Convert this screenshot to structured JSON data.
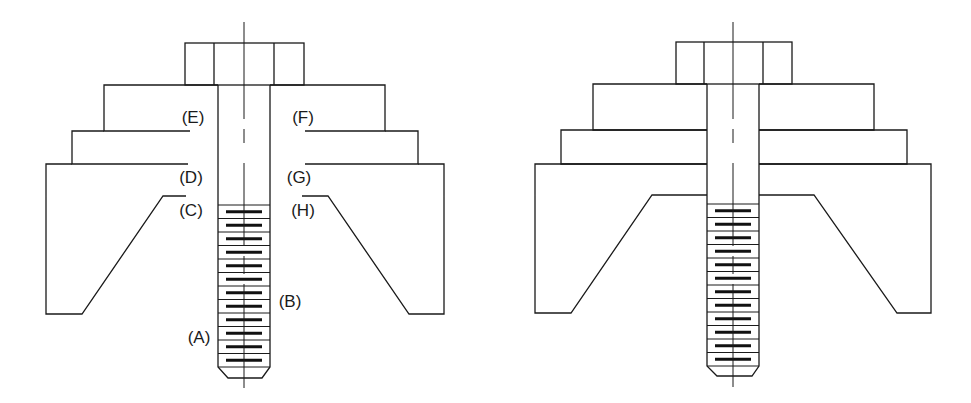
{
  "diagram": {
    "type": "technical-cross-section",
    "line_color": "#1a1a1a",
    "background": "#ffffff"
  },
  "views": [
    {
      "id": "labeled",
      "cx": 244,
      "head": {
        "x1": 185,
        "x2": 304,
        "y1": 43,
        "y2": 85,
        "inner": [
          214,
          274
        ]
      },
      "washer": {
        "x1": 104,
        "x2": 385,
        "y1": 85,
        "y2": 131
      },
      "plate": {
        "x1": 72,
        "x2": 418,
        "y1": 131,
        "y2": 164
      },
      "block": {
        "x1": 46,
        "x2": 444,
        "y1": 164,
        "y2": 314,
        "cav_top": 196,
        "cav_top_l": 163,
        "cav_top_r": 328,
        "cav_bot_l": 82,
        "cav_bot_r": 409
      },
      "shank": {
        "x1": 218,
        "x2": 270,
        "thread_start": 205,
        "thread_end": 367,
        "tip_y": 378,
        "tip_x1": 228,
        "tip_x2": 262
      },
      "gap_marks": {
        "E": [
          172,
          190
        ],
        "F": [
          305,
          320
        ],
        "D": [
          175,
          188
        ],
        "G": [
          305,
          322
        ],
        "C": [
          163,
          186
        ],
        "H": [
          302,
          328
        ]
      },
      "centerline": {
        "top": 22,
        "bottom": 388
      },
      "labels": [
        {
          "id": "E",
          "text": "(E)",
          "x": 193,
          "y": 123
        },
        {
          "id": "F",
          "text": "(F)",
          "x": 303,
          "y": 123
        },
        {
          "id": "D",
          "text": "(D)",
          "x": 191,
          "y": 183
        },
        {
          "id": "G",
          "text": "(G)",
          "x": 299,
          "y": 183
        },
        {
          "id": "C",
          "text": "(C)",
          "x": 191,
          "y": 216
        },
        {
          "id": "H",
          "text": "(H)",
          "x": 303,
          "y": 216
        },
        {
          "id": "B",
          "text": "(B)",
          "x": 290,
          "y": 307
        },
        {
          "id": "A",
          "text": "(A)",
          "x": 199,
          "y": 343
        }
      ]
    },
    {
      "id": "unlabeled",
      "cx": 733,
      "head": {
        "x1": 676,
        "x2": 792,
        "y1": 42,
        "y2": 84,
        "inner": [
          704,
          763
        ]
      },
      "washer": {
        "x1": 593,
        "x2": 874,
        "y1": 84,
        "y2": 130
      },
      "plate": {
        "x1": 561,
        "x2": 907,
        "y1": 130,
        "y2": 164
      },
      "block": {
        "x1": 535,
        "x2": 931,
        "y1": 164,
        "y2": 313,
        "cav_top": 195,
        "cav_top_l": 652,
        "cav_top_r": 814,
        "cav_bot_l": 571,
        "cav_bot_r": 897
      },
      "shank": {
        "x1": 707,
        "x2": 759,
        "thread_start": 204,
        "thread_end": 366,
        "tip_y": 376,
        "tip_x1": 717,
        "tip_x2": 752
      },
      "centerline": {
        "top": 22,
        "bottom": 387
      },
      "labels": []
    }
  ]
}
